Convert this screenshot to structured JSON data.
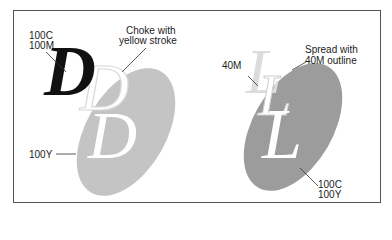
{
  "panels": {
    "left": {
      "labels": {
        "black_d": [
          "100C",
          "100M"
        ],
        "choke": [
          "Choke with",
          "yellow stroke"
        ],
        "ellipse": "100Y"
      },
      "letter": "D",
      "colors": {
        "ellipse": "#c4c4c4",
        "letter_front": "#111111",
        "letter_ghost": "#e6e6e6",
        "letter_knockout": "#ffffff"
      }
    },
    "right": {
      "labels": {
        "ghost_l": "40M",
        "spread": [
          "Spread with",
          "40M outline"
        ],
        "ellipse": [
          "100C",
          "100Y"
        ]
      },
      "letter": "L",
      "colors": {
        "ellipse": "#9c9c9c",
        "letter_ghost": "#dcdcdc",
        "letter_knockout": "#ffffff"
      }
    }
  }
}
